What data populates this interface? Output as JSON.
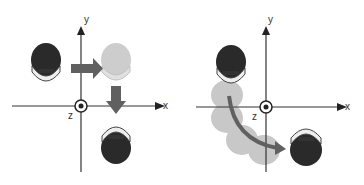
{
  "left_panel": {
    "axis_x_label": "x",
    "axis_y_label": "y",
    "axis_z_label": "z",
    "description": "discrete translation: move right then down"
  },
  "right_panel": {
    "axis_x_label": "x",
    "axis_y_label": "y",
    "axis_z_label": "z",
    "description": "continuous rotation around z axis"
  },
  "colors": {
    "axis": "#333333",
    "arrow": "#606060",
    "figure_dark": "#2a2a2a",
    "figure_ghost": "#c8c8c8"
  }
}
